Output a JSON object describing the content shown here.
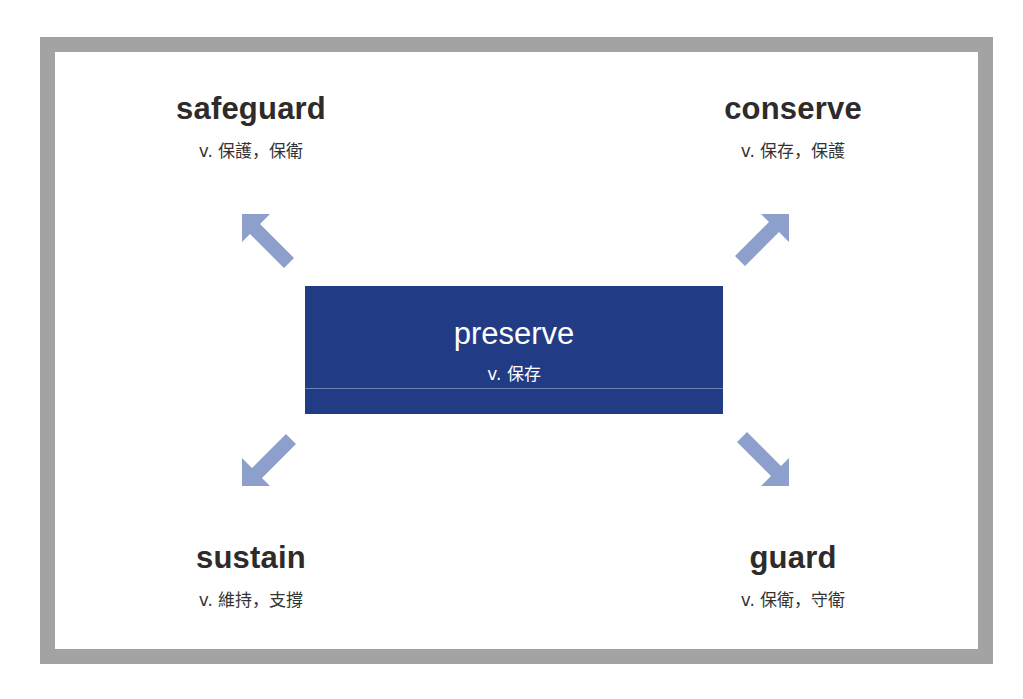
{
  "center": {
    "word": "preserve",
    "definition": "v. 保存"
  },
  "terms": [
    {
      "id": "safeguard",
      "word": "safeguard",
      "definition": "v. 保護，保衛",
      "position": "top-left"
    },
    {
      "id": "conserve",
      "word": "conserve",
      "definition": "v. 保存，保護",
      "position": "top-right"
    },
    {
      "id": "sustain",
      "word": "sustain",
      "definition": "v. 維持，支撐",
      "position": "bottom-left"
    },
    {
      "id": "guard",
      "word": "guard",
      "definition": "v. 保衛，守衛",
      "position": "bottom-right"
    }
  ],
  "arrows": [
    {
      "icon": "arrow-up-left-icon",
      "direction": "up-left"
    },
    {
      "icon": "arrow-up-right-icon",
      "direction": "up-right"
    },
    {
      "icon": "arrow-down-left-icon",
      "direction": "down-left"
    },
    {
      "icon": "arrow-down-right-icon",
      "direction": "down-right"
    }
  ],
  "colors": {
    "frame": "#a3a3a3",
    "center_box": "#213c85",
    "arrow": "#8d9fcb",
    "word_text": "#2e2b2a"
  }
}
